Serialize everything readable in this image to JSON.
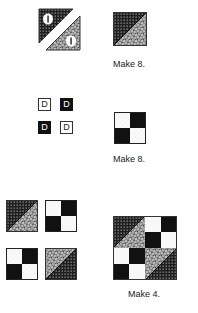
{
  "steps": [
    {
      "id": "half-square-triangles",
      "caption": "Make 8.",
      "piece_label": "I"
    },
    {
      "id": "four-patch",
      "caption": "Make 8.",
      "piece_label": "D"
    },
    {
      "id": "block-assembly",
      "caption": "Make 4."
    }
  ],
  "colors": {
    "dark": "#111111",
    "light": "#ffffff",
    "outline": "#333333"
  }
}
